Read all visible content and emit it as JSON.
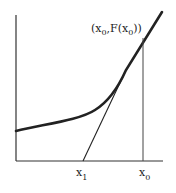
{
  "diagram": {
    "type": "newton-method-tangent",
    "colors": {
      "background": "#ffffff",
      "stroke": "#222222"
    },
    "point_label": {
      "open": "(x",
      "sub1": "0",
      "mid": ",F(x",
      "sub2": "0",
      "close": "))"
    },
    "x_labels": [
      {
        "base": "x",
        "sub": "1"
      },
      {
        "base": "x",
        "sub": "0"
      }
    ]
  }
}
